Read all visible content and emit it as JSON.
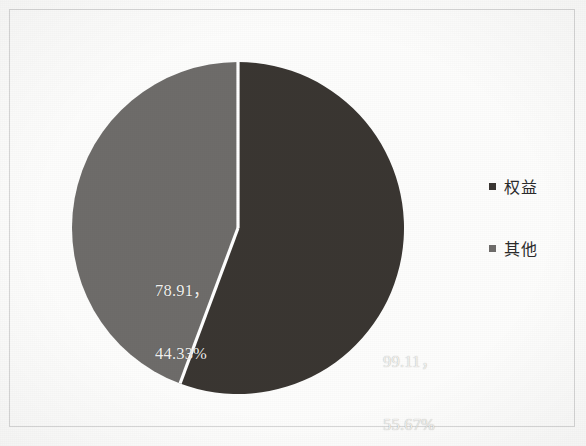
{
  "figure": {
    "background_color": "#fdfdfc",
    "frame_color": "#d7d7d7"
  },
  "chart_data": {
    "type": "pie",
    "title": "",
    "subtitle": "",
    "xlabel": "",
    "ylabel": "",
    "grid": false,
    "legend_position": "right",
    "start_angle_deg": 0,
    "direction": "clockwise",
    "categories": [
      "权益",
      "其他"
    ],
    "values": [
      99.11,
      78.91
    ],
    "percentages": [
      55.67,
      44.33
    ],
    "total": 178.02,
    "colors": [
      "#3a3632",
      "#6e6c6a"
    ],
    "separator_color": "#ffffff",
    "label_text_color": "#f2f1ef",
    "slices": [
      {
        "name": "权益",
        "value": 99.11,
        "percent": 55.67,
        "color": "#3a3632",
        "label_value": "99.11，",
        "label_percent": "55.67%"
      },
      {
        "name": "其他",
        "value": 78.91,
        "percent": 44.33,
        "color": "#6e6c6a",
        "label_value": "78.91，",
        "label_percent": "44.33%"
      }
    ]
  },
  "labels": {
    "equity": {
      "value": "99.11，",
      "percent": "55.67%"
    },
    "other": {
      "value": "78.91，",
      "percent": "44.33%"
    }
  },
  "legend": {
    "items": [
      {
        "label": "权益",
        "color": "#3a3632"
      },
      {
        "label": "其他",
        "color": "#6e6c6a"
      }
    ]
  }
}
